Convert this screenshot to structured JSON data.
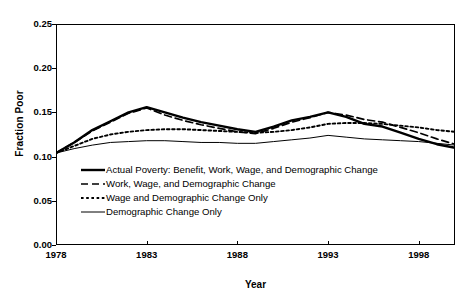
{
  "chart_data": {
    "type": "line",
    "title": "",
    "xlabel": "Year",
    "ylabel": "Fraction Poor",
    "xlim": [
      1978,
      2000
    ],
    "ylim": [
      0.0,
      0.25
    ],
    "xticks": [
      "1978",
      "1983",
      "1988",
      "1993",
      "1998"
    ],
    "xtick_values": [
      1978,
      1983,
      1988,
      1993,
      1998
    ],
    "yticks": [
      "0.00",
      "0.05",
      "0.10",
      "0.15",
      "0.20",
      "0.25"
    ],
    "ytick_values": [
      0.0,
      0.05,
      0.1,
      0.15,
      0.2,
      0.25
    ],
    "grid": false,
    "legend_position": "inside-lower-left",
    "x": [
      1978,
      1979,
      1980,
      1981,
      1982,
      1983,
      1984,
      1985,
      1986,
      1987,
      1988,
      1989,
      1990,
      1991,
      1992,
      1993,
      1994,
      1995,
      1996,
      1997,
      1998,
      1999,
      2000
    ],
    "series": [
      {
        "name": "Actual Poverty: Benefit, Work, Wage, and Demographic Change",
        "style": "solid-thick",
        "color": "#000000",
        "values": [
          0.104,
          0.116,
          0.13,
          0.14,
          0.15,
          0.156,
          0.15,
          0.144,
          0.139,
          0.135,
          0.131,
          0.128,
          0.134,
          0.141,
          0.145,
          0.15,
          0.145,
          0.137,
          0.134,
          0.127,
          0.12,
          0.114,
          0.11
        ]
      },
      {
        "name": "Work, Wage, and Demographic Change",
        "style": "dashed",
        "color": "#000000",
        "values": [
          0.104,
          0.116,
          0.129,
          0.139,
          0.149,
          0.155,
          0.147,
          0.141,
          0.136,
          0.132,
          0.128,
          0.126,
          0.132,
          0.139,
          0.144,
          0.15,
          0.147,
          0.142,
          0.139,
          0.133,
          0.127,
          0.12,
          0.114
        ]
      },
      {
        "name": "Wage and Demographic Change Only",
        "style": "dotted",
        "color": "#000000",
        "values": [
          0.104,
          0.112,
          0.12,
          0.125,
          0.128,
          0.13,
          0.131,
          0.131,
          0.13,
          0.129,
          0.128,
          0.127,
          0.128,
          0.13,
          0.133,
          0.137,
          0.138,
          0.138,
          0.137,
          0.135,
          0.133,
          0.13,
          0.128
        ]
      },
      {
        "name": "Demographic Change Only",
        "style": "solid-thin",
        "color": "#000000",
        "values": [
          0.104,
          0.109,
          0.113,
          0.116,
          0.117,
          0.118,
          0.118,
          0.117,
          0.116,
          0.116,
          0.115,
          0.115,
          0.117,
          0.119,
          0.121,
          0.124,
          0.122,
          0.12,
          0.119,
          0.118,
          0.117,
          0.115,
          0.113
        ]
      }
    ]
  },
  "axes": {
    "y_title": "Fraction Poor",
    "x_title": "Year"
  },
  "legend": {
    "items": [
      {
        "label": "Actual Poverty: Benefit, Work, Wage, and Demographic Change",
        "style": "solid-thick"
      },
      {
        "label": "Work, Wage, and Demographic Change",
        "style": "dashed"
      },
      {
        "label": "Wage and Demographic Change Only",
        "style": "dotted"
      },
      {
        "label": "Demographic Change Only",
        "style": "solid-thin"
      }
    ]
  }
}
